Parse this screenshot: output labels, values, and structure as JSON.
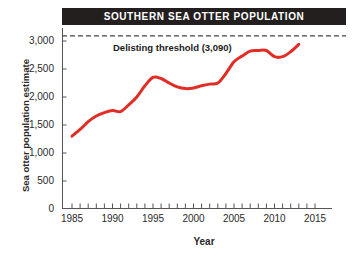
{
  "title": "SOUTHERN SEA OTTER POPULATION",
  "axis": {
    "xlabel": "Year",
    "ylabel": "Sea otter population estimate"
  },
  "annotation": {
    "threshold_label": "Delisting threshold (3,090)",
    "threshold_value": 3090
  },
  "colors": {
    "line": "#e12d26",
    "banner": "#231f1f",
    "banner_text": "#ffffff",
    "axis": "#555555",
    "threshold": "#444444",
    "text": "#2a2a2a"
  },
  "yticks": [
    {
      "value": 0,
      "label": "0"
    },
    {
      "value": 500,
      "label": "500"
    },
    {
      "value": 1000,
      "label": "1,000"
    },
    {
      "value": 1500,
      "label": "1,500"
    },
    {
      "value": 2000,
      "label": "2,000"
    },
    {
      "value": 2500,
      "label": "2,500"
    },
    {
      "value": 3000,
      "label": "3,000"
    }
  ],
  "xticks": [
    {
      "value": 1985,
      "label": "1985"
    },
    {
      "value": 1990,
      "label": "1990"
    },
    {
      "value": 1995,
      "label": "1995"
    },
    {
      "value": 2000,
      "label": "2000"
    },
    {
      "value": 2005,
      "label": "2005"
    },
    {
      "value": 2010,
      "label": "2010"
    },
    {
      "value": 2015,
      "label": "2015"
    }
  ],
  "chart_data": {
    "type": "line",
    "title": "SOUTHERN SEA OTTER POPULATION",
    "xlabel": "Year",
    "ylabel": "Sea otter population estimate",
    "xlim": [
      1984,
      2016
    ],
    "ylim": [
      0,
      3200
    ],
    "grid": false,
    "legend": "none",
    "x_tick_labels": [
      "1985",
      "1990",
      "1995",
      "2000",
      "2005",
      "2010",
      "2015"
    ],
    "y_tick_labels": [
      "0",
      "500",
      "1,000",
      "1,500",
      "2,000",
      "2,500",
      "3,000"
    ],
    "minor_x_ticks_every": 1,
    "annotations": [
      {
        "type": "hline",
        "y": 3090,
        "style": "dashed",
        "label": "Delisting threshold (3,090)",
        "color": "#444444"
      }
    ],
    "series": [
      {
        "name": "Sea otter population estimate",
        "color": "#e12d26",
        "x": [
          1985,
          1986,
          1987,
          1988,
          1989,
          1990,
          1991,
          1992,
          1993,
          1994,
          1995,
          1996,
          1997,
          1998,
          1999,
          2000,
          2001,
          2002,
          2003,
          2004,
          2005,
          2006,
          2007,
          2008,
          2009,
          2010,
          2011,
          2012,
          2013
        ],
        "values": [
          1300,
          1420,
          1560,
          1660,
          1720,
          1760,
          1740,
          1860,
          2000,
          2200,
          2350,
          2330,
          2250,
          2180,
          2150,
          2160,
          2200,
          2230,
          2250,
          2420,
          2630,
          2730,
          2820,
          2830,
          2830,
          2720,
          2720,
          2810,
          2940
        ]
      }
    ]
  }
}
